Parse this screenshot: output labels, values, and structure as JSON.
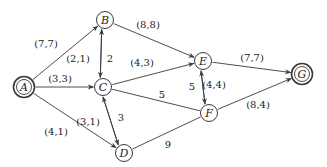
{
  "diagram": {
    "type": "flow-network",
    "colors": {
      "stroke": "#3a3a3a",
      "text": "#222222",
      "background": "#ffffff"
    },
    "nodes": [
      {
        "id": "A",
        "label": "A",
        "x": 24,
        "y": 87,
        "double": true
      },
      {
        "id": "B",
        "label": "B",
        "x": 105,
        "y": 20,
        "double": false
      },
      {
        "id": "C",
        "label": "C",
        "x": 103,
        "y": 87,
        "double": false
      },
      {
        "id": "D",
        "label": "D",
        "x": 124,
        "y": 153,
        "double": false
      },
      {
        "id": "E",
        "label": "E",
        "x": 203,
        "y": 61,
        "double": false
      },
      {
        "id": "F",
        "label": "F",
        "x": 209,
        "y": 113,
        "double": false
      },
      {
        "id": "G",
        "label": "G",
        "x": 302,
        "y": 74,
        "double": true
      }
    ],
    "edges": [
      {
        "from": "A",
        "to": "B",
        "label": "(7,7)",
        "lx": 46,
        "ly": 47,
        "arrow": true
      },
      {
        "from": "A",
        "to": "C",
        "label": "(3,3)",
        "lx": 60,
        "ly": 82,
        "arrow": true
      },
      {
        "from": "A",
        "to": "D",
        "label": "(4,1)",
        "lx": 56,
        "ly": 135,
        "arrow": true
      },
      {
        "from": "C",
        "to": "B",
        "label": "(2,1)",
        "lx": 78,
        "ly": 62,
        "arrow": true,
        "offset": -3
      },
      {
        "from": "B",
        "to": "C",
        "label": "2",
        "lx": 110,
        "ly": 62,
        "arrow": true,
        "offset": 3
      },
      {
        "from": "B",
        "to": "E",
        "label": "(8,8)",
        "lx": 148,
        "ly": 28,
        "arrow": true
      },
      {
        "from": "C",
        "to": "E",
        "label": "(4,3)",
        "lx": 142,
        "ly": 66,
        "arrow": true
      },
      {
        "from": "C",
        "to": "F",
        "label": "5",
        "lx": 162,
        "ly": 98,
        "arrow": false
      },
      {
        "from": "D",
        "to": "C",
        "label": "(3,1)",
        "lx": 88,
        "ly": 125,
        "arrow": true,
        "offset": -3
      },
      {
        "from": "C",
        "to": "D",
        "label": "3",
        "lx": 121,
        "ly": 121,
        "arrow": true,
        "offset": 3
      },
      {
        "from": "D",
        "to": "F",
        "label": "9",
        "lx": 168,
        "ly": 148,
        "arrow": false
      },
      {
        "from": "F",
        "to": "E",
        "label": "5",
        "lx": 192,
        "ly": 90,
        "arrow": true,
        "offset": -3
      },
      {
        "from": "E",
        "to": "F",
        "label": "(4,4)",
        "lx": 214,
        "ly": 88,
        "arrow": true,
        "offset": 3
      },
      {
        "from": "E",
        "to": "G",
        "label": "(7,7)",
        "lx": 252,
        "ly": 61,
        "arrow": true
      },
      {
        "from": "F",
        "to": "G",
        "label": "(8,4)",
        "lx": 258,
        "ly": 108,
        "arrow": true
      }
    ]
  }
}
